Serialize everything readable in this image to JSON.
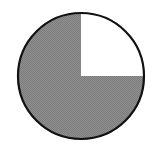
{
  "diagram": {
    "type": "fraction-circle",
    "parts_total": 4,
    "parts_shaded": 3,
    "unshaded_quadrant": "top-right",
    "fraction_shaded": "3/4",
    "colors": {
      "shaded": "#8a8a8a",
      "unshaded": "#ffffff",
      "outline": "#111111"
    }
  }
}
